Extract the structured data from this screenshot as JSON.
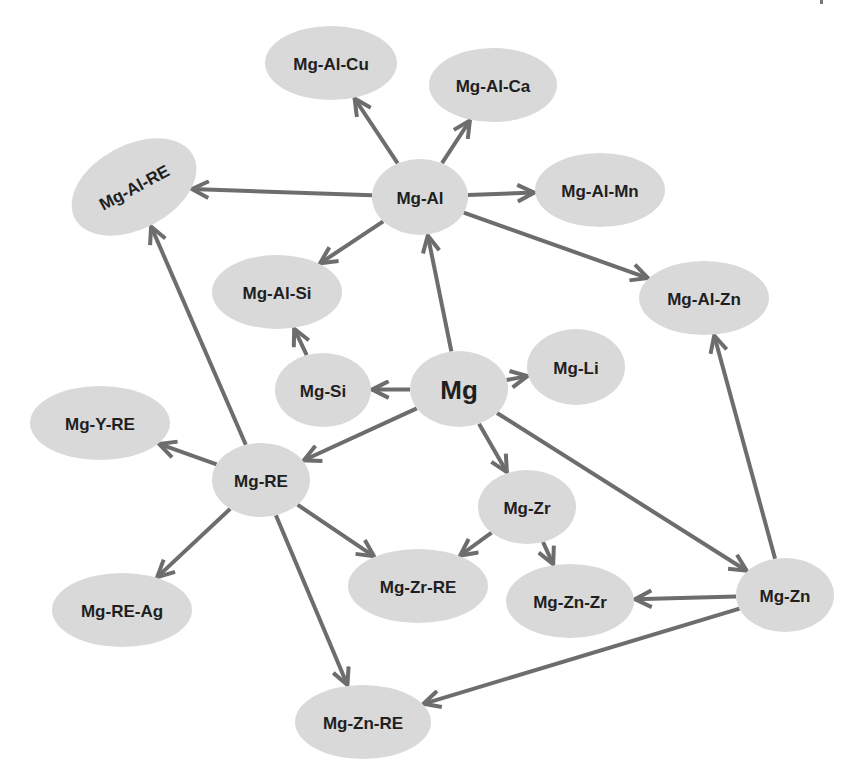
{
  "diagram": {
    "title": "",
    "colors": {
      "node_fill": "#d9d9d9",
      "edge": "#6d6d6d",
      "text": "#1f1f1f",
      "background": "#ffffff"
    },
    "nodes": [
      {
        "id": "mg",
        "label": "Mg",
        "cx": 459,
        "cy": 389,
        "rx": 49,
        "ry": 38,
        "big": true
      },
      {
        "id": "mg-al",
        "label": "Mg-Al",
        "cx": 420,
        "cy": 197,
        "rx": 48,
        "ry": 38
      },
      {
        "id": "mg-al-cu",
        "label": "Mg-Al-Cu",
        "cx": 331,
        "cy": 63,
        "rx": 66,
        "ry": 37
      },
      {
        "id": "mg-al-ca",
        "label": "Mg-Al-Ca",
        "cx": 493,
        "cy": 85,
        "rx": 64,
        "ry": 37
      },
      {
        "id": "mg-al-re",
        "label": "Mg-Al-RE",
        "cx": 134,
        "cy": 187,
        "rx": 67,
        "ry": 42,
        "rotate": -28
      },
      {
        "id": "mg-al-mn",
        "label": "Mg-Al-Mn",
        "cx": 600,
        "cy": 190,
        "rx": 65,
        "ry": 37
      },
      {
        "id": "mg-al-si",
        "label": "Mg-Al-Si",
        "cx": 277,
        "cy": 292,
        "rx": 65,
        "ry": 37
      },
      {
        "id": "mg-al-zn",
        "label": "Mg-Al-Zn",
        "cx": 704,
        "cy": 298,
        "rx": 65,
        "ry": 37
      },
      {
        "id": "mg-si",
        "label": "Mg-Si",
        "cx": 323,
        "cy": 390,
        "rx": 48,
        "ry": 37
      },
      {
        "id": "mg-li",
        "label": "Mg-Li",
        "cx": 576,
        "cy": 367,
        "rx": 49,
        "ry": 38
      },
      {
        "id": "mg-y-re",
        "label": "Mg-Y-RE",
        "cx": 100,
        "cy": 423,
        "rx": 70,
        "ry": 37
      },
      {
        "id": "mg-re",
        "label": "Mg-RE",
        "cx": 261,
        "cy": 480,
        "rx": 49,
        "ry": 37
      },
      {
        "id": "mg-zr",
        "label": "Mg-Zr",
        "cx": 527,
        "cy": 507,
        "rx": 49,
        "ry": 37
      },
      {
        "id": "mg-zr-re",
        "label": "Mg-Zr-RE",
        "cx": 418,
        "cy": 586,
        "rx": 70,
        "ry": 37
      },
      {
        "id": "mg-zn-zr",
        "label": "Mg-Zn-Zr",
        "cx": 570,
        "cy": 601,
        "rx": 64,
        "ry": 37
      },
      {
        "id": "mg-zn",
        "label": "Mg-Zn",
        "cx": 785,
        "cy": 595,
        "rx": 49,
        "ry": 37
      },
      {
        "id": "mg-re-ag",
        "label": "Mg-RE-Ag",
        "cx": 122,
        "cy": 610,
        "rx": 70,
        "ry": 37
      },
      {
        "id": "mg-zn-re",
        "label": "Mg-Zn-RE",
        "cx": 363,
        "cy": 722,
        "rx": 68,
        "ry": 37
      }
    ],
    "edges": [
      {
        "from": "mg",
        "to": "mg-al"
      },
      {
        "from": "mg",
        "to": "mg-si"
      },
      {
        "from": "mg",
        "to": "mg-li"
      },
      {
        "from": "mg",
        "to": "mg-re"
      },
      {
        "from": "mg",
        "to": "mg-zr"
      },
      {
        "from": "mg",
        "to": "mg-zn"
      },
      {
        "from": "mg-al",
        "to": "mg-al-cu"
      },
      {
        "from": "mg-al",
        "to": "mg-al-ca"
      },
      {
        "from": "mg-al",
        "to": "mg-al-re"
      },
      {
        "from": "mg-al",
        "to": "mg-al-mn"
      },
      {
        "from": "mg-al",
        "to": "mg-al-si"
      },
      {
        "from": "mg-al",
        "to": "mg-al-zn"
      },
      {
        "from": "mg-si",
        "to": "mg-al-si"
      },
      {
        "from": "mg-re",
        "to": "mg-al-re"
      },
      {
        "from": "mg-re",
        "to": "mg-y-re"
      },
      {
        "from": "mg-re",
        "to": "mg-re-ag"
      },
      {
        "from": "mg-re",
        "to": "mg-zr-re"
      },
      {
        "from": "mg-re",
        "to": "mg-zn-re"
      },
      {
        "from": "mg-zr",
        "to": "mg-zr-re"
      },
      {
        "from": "mg-zr",
        "to": "mg-zn-zr"
      },
      {
        "from": "mg-zn",
        "to": "mg-zn-zr"
      },
      {
        "from": "mg-zn",
        "to": "mg-al-zn"
      },
      {
        "from": "mg-zn",
        "to": "mg-zn-re"
      }
    ]
  }
}
